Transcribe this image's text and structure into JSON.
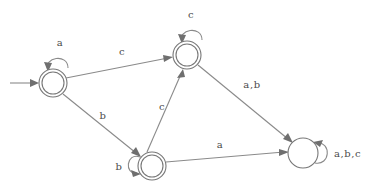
{
  "figure": {
    "kind": "finite-state-automaton-diagram",
    "background_color": "#ffffff",
    "stroke_color": "#8a8a8a",
    "label_color": "#4a4a4a"
  },
  "start_arrow": {
    "name": "start-arrow",
    "from_x": 10,
    "to_x": 37,
    "y": 83
  },
  "states": [
    {
      "id": "q0",
      "name": "state-top-left",
      "cx": 53,
      "cy": 83,
      "r_outer": 14,
      "r_inner": 11,
      "accepting": true,
      "is_start": true
    },
    {
      "id": "q1",
      "name": "state-top-middle",
      "cx": 187,
      "cy": 55,
      "r_outer": 14,
      "r_inner": 11,
      "accepting": true,
      "is_start": false
    },
    {
      "id": "q2",
      "name": "state-bottom-middle",
      "cx": 152,
      "cy": 166,
      "r_outer": 14,
      "r_inner": 11,
      "accepting": true,
      "is_start": false
    },
    {
      "id": "q3",
      "name": "state-right-trap",
      "cx": 303,
      "cy": 153,
      "r_outer": 15,
      "r_inner": 0,
      "accepting": false,
      "is_start": false
    }
  ],
  "self_loops": [
    {
      "name": "self-loop-top-left",
      "state": "q0",
      "label": "a",
      "label_x": 60,
      "label_y": 46,
      "position": "top"
    },
    {
      "name": "self-loop-top-middle",
      "state": "q1",
      "label": "c",
      "label_x": 191,
      "label_y": 18,
      "position": "top"
    },
    {
      "name": "self-loop-bottom-middle",
      "state": "q2",
      "label": "b",
      "label_x": 119,
      "label_y": 170,
      "position": "left"
    },
    {
      "name": "self-loop-right-trap",
      "state": "q3",
      "label": "a,b,c",
      "label_x": 348,
      "label_y": 157,
      "position": "right"
    }
  ],
  "transitions": [
    {
      "name": "edge-q0-to-q1",
      "from": "q0",
      "to": "q1",
      "label": "c",
      "label_x": 122,
      "label_y": 55
    },
    {
      "name": "edge-q0-to-q2",
      "from": "q0",
      "to": "q2",
      "label": "b",
      "label_x": 103,
      "label_y": 119
    },
    {
      "name": "edge-q2-to-q1",
      "from": "q2",
      "to": "q1",
      "label": "c",
      "label_x": 162,
      "label_y": 110
    },
    {
      "name": "edge-q1-to-q3",
      "from": "q1",
      "to": "q3",
      "label": "a,b",
      "label_x": 252,
      "label_y": 88
    },
    {
      "name": "edge-q2-to-q3",
      "from": "q2",
      "to": "q3",
      "label": "a",
      "label_x": 220,
      "label_y": 148
    }
  ]
}
